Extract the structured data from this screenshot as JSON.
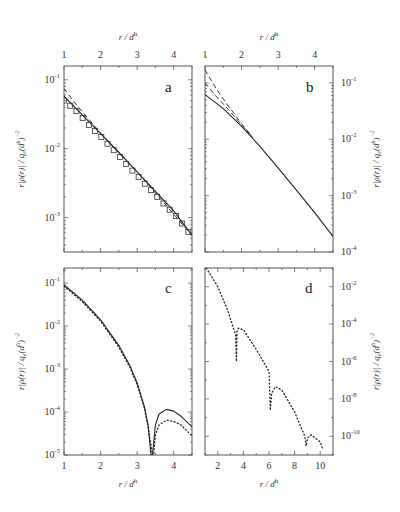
{
  "figure": {
    "panels": [
      "a",
      "b",
      "c",
      "d"
    ],
    "x_axis_label": "r / d^h",
    "y_axis_label": "r|ρ(r)| / q_e(d^h)^-2"
  },
  "chart_data": [
    {
      "panel": "a",
      "type": "line",
      "title": "a",
      "xlabel": "r / d^h",
      "ylabel": "r|ρ(r)| / q_e(d^h)^-2",
      "xlim": [
        1,
        4.5
      ],
      "ylim_log10": [
        -3.5,
        -0.8
      ],
      "yscale": "log",
      "x_ticks": [
        1,
        2,
        3,
        4
      ],
      "x_tick_labels_position": "top",
      "y_ticks": [
        "10^-1",
        "10^-2",
        "10^-3"
      ],
      "y_tick_labels_position": "left",
      "series": [
        {
          "name": "solid",
          "style": "solid",
          "x": [
            1.0,
            1.5,
            2.0,
            2.5,
            3.0,
            3.5,
            4.0,
            4.5
          ],
          "y": [
            0.058,
            0.031,
            0.0165,
            0.0088,
            0.0046,
            0.0024,
            0.00125,
            0.00055
          ]
        },
        {
          "name": "dashed",
          "style": "dashed",
          "x": [
            1.0,
            1.3,
            1.6,
            2.0,
            3.0,
            4.5
          ],
          "y": [
            0.075,
            0.046,
            0.03,
            0.0168,
            0.0046,
            0.00055
          ]
        },
        {
          "name": "squares",
          "style": "markers-square",
          "x": [
            1.0,
            1.17,
            1.34,
            1.51,
            1.68,
            1.85,
            2.02,
            2.19,
            2.36,
            2.53,
            2.7,
            2.87,
            3.04,
            3.21,
            3.38,
            3.55,
            3.72,
            3.89,
            4.06,
            4.23,
            4.4
          ],
          "y": [
            0.05,
            0.042,
            0.035,
            0.028,
            0.022,
            0.018,
            0.0148,
            0.0118,
            0.0095,
            0.0076,
            0.006,
            0.0048,
            0.0039,
            0.0031,
            0.0025,
            0.002,
            0.0016,
            0.0013,
            0.00105,
            0.00082,
            0.00062
          ]
        }
      ]
    },
    {
      "panel": "b",
      "type": "line",
      "title": "b",
      "xlabel": "r / d^h",
      "ylabel": "r|ρ(r)| / q_e(d^h)^-2",
      "xlim": [
        1,
        4.5
      ],
      "ylim_log10": [
        -4,
        -0.7
      ],
      "yscale": "log",
      "x_ticks": [
        1,
        2,
        3,
        4
      ],
      "x_tick_labels_position": "top",
      "y_ticks": [
        "10^-1",
        "10^-2",
        "10^-3",
        "10^-4"
      ],
      "y_tick_labels_position": "right",
      "series": [
        {
          "name": "solid",
          "style": "solid",
          "x": [
            1.0,
            1.5,
            2.0,
            2.5,
            3.0,
            3.5,
            4.0,
            4.5
          ],
          "y": [
            0.062,
            0.035,
            0.017,
            0.0075,
            0.0031,
            0.00125,
            0.0005,
            0.00019
          ]
        },
        {
          "name": "dashed-1",
          "style": "dashed",
          "x": [
            1.0,
            1.3,
            1.6,
            2.0,
            2.3
          ],
          "y": [
            0.17,
            0.08,
            0.042,
            0.019,
            0.011
          ]
        },
        {
          "name": "dashed-2",
          "style": "dashed",
          "x": [
            1.0,
            1.3,
            1.6,
            2.0,
            2.3
          ],
          "y": [
            0.1,
            0.058,
            0.036,
            0.018,
            0.011
          ]
        }
      ]
    },
    {
      "panel": "c",
      "type": "line",
      "title": "c",
      "xlabel": "r / d^h",
      "ylabel": "r|ρ(r)| / q_e(d^h)^-2",
      "xlim": [
        1,
        4.5
      ],
      "ylim_log10": [
        -5,
        -0.65
      ],
      "yscale": "log",
      "x_ticks": [
        1,
        2,
        3,
        4
      ],
      "x_tick_labels_position": "bottom",
      "y_ticks": [
        "10^-1",
        "10^-2",
        "10^-3",
        "10^-4",
        "10^-5"
      ],
      "y_tick_labels_position": "left",
      "series": [
        {
          "name": "solid",
          "style": "solid",
          "x": [
            1.0,
            1.5,
            2.0,
            2.5,
            2.8,
            3.0,
            3.2,
            3.3,
            3.38,
            3.4,
            3.42,
            3.5,
            3.6,
            3.8,
            4.0,
            4.2,
            4.5
          ],
          "y": [
            0.09,
            0.04,
            0.014,
            0.0035,
            0.0012,
            0.00048,
            0.00013,
            5e-05,
            1e-05,
            1e-05,
            1e-05,
            5e-05,
            9e-05,
            0.000115,
            0.000105,
            8e-05,
            4.5e-05
          ]
        },
        {
          "name": "dotted",
          "style": "dotted",
          "x": [
            1.0,
            1.5,
            2.0,
            2.5,
            2.8,
            3.0,
            3.2,
            3.3,
            3.42,
            3.45,
            3.5,
            3.6,
            3.8,
            4.0,
            4.2,
            4.5
          ],
          "y": [
            0.085,
            0.037,
            0.013,
            0.0032,
            0.0011,
            0.00044,
            0.00012,
            4.5e-05,
            1e-05,
            1e-05,
            3e-05,
            5e-05,
            6.5e-05,
            6e-05,
            5e-05,
            2.8e-05
          ]
        }
      ]
    },
    {
      "panel": "d",
      "type": "line",
      "title": "d",
      "xlabel": "r / d^h",
      "ylabel": "r|ρ(r)| / q_e(d^h)^-2",
      "xlim": [
        1,
        11
      ],
      "ylim_log10": [
        -11,
        -1
      ],
      "yscale": "log",
      "x_ticks": [
        2,
        4,
        6,
        8,
        10
      ],
      "x_tick_labels_position": "bottom",
      "y_ticks": [
        "10^-2",
        "10^-4",
        "10^-6",
        "10^-8",
        "10^-10"
      ],
      "y_tick_labels_position": "right",
      "series": [
        {
          "name": "dotted",
          "style": "dotted",
          "x": [
            1.1,
            2.0,
            2.8,
            3.4,
            3.45,
            3.5,
            3.6,
            4.0,
            5.0,
            6.0,
            6.1,
            6.2,
            6.5,
            7.0,
            8.0,
            8.8,
            8.9,
            9.0,
            9.3,
            10.0,
            10.2
          ],
          "y": [
            0.1,
            0.01,
            0.0005,
            2.5e-05,
            1e-06,
            4e-05,
            6e-05,
            5e-05,
            4.5e-06,
            3e-07,
            2.5e-09,
            2e-08,
            4.5e-08,
            3e-08,
            2e-09,
            1e-10,
            3e-11,
            8e-11,
            1.2e-10,
            5e-11,
            2e-11
          ]
        }
      ]
    }
  ]
}
